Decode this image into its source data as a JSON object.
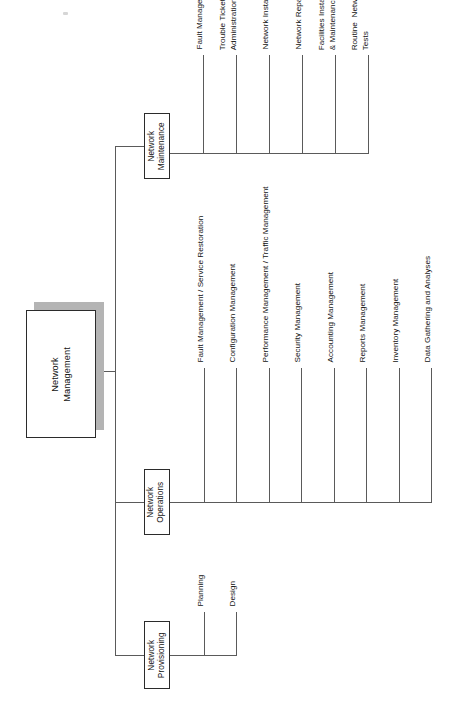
{
  "diagram": {
    "orientation": "rotated-90",
    "root": {
      "label": "Network\nManagement"
    },
    "branches": [
      {
        "id": "network-maintenance",
        "label": "Network\nMaintenance",
        "leaves": [
          "Fault Management",
          "Trouble Ticket\nAdministration",
          "Network Installation",
          "Network Repairs",
          "Facilities Installation\n& Maintenance",
          "Routine  Network\nTests"
        ]
      },
      {
        "id": "network-operations",
        "label": "Network\nOperations",
        "leaves": [
          "Fault Management / Service Restoration",
          "Configuration Management",
          "Performance Management / Traffic Management",
          "Security Management",
          "Accounting Management",
          "Reports Management",
          "Inventory Management",
          "Data Gathering and Analyses"
        ]
      },
      {
        "id": "network-provisioning",
        "label": "Network\nProvisioning",
        "leaves": [
          "Planning",
          "Design"
        ]
      }
    ],
    "colors": {
      "line": "#5a5a5a",
      "box_border": "#2b2b2b",
      "shadow": "#b4b4b4",
      "text": "#121212",
      "background": "#ffffff"
    }
  }
}
